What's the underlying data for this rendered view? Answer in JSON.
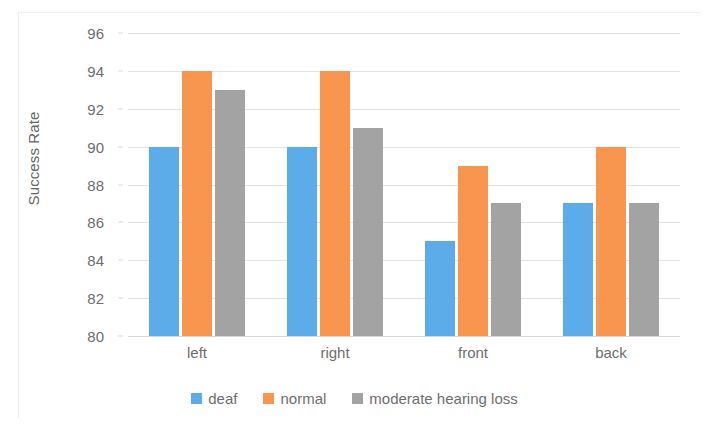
{
  "chart_data": {
    "type": "bar",
    "title": "",
    "subtitle": "",
    "xlabel": "",
    "ylabel": "Success Rate",
    "categories": [
      "left",
      "right",
      "front",
      "back"
    ],
    "series": [
      {
        "name": "deaf",
        "color": "#5BACE8",
        "values": [
          90,
          90,
          85,
          87
        ]
      },
      {
        "name": "normal",
        "color": "#F89650",
        "values": [
          94,
          94,
          89,
          90
        ]
      },
      {
        "name": "moderate hearing loss",
        "color": "#A3A3A3",
        "values": [
          93,
          91,
          87,
          87
        ]
      }
    ],
    "ylim": [
      80,
      96
    ],
    "ytick_step": 2,
    "yticks": [
      96,
      94,
      92,
      90,
      88,
      86,
      84,
      82,
      80
    ],
    "ytick_labels": [
      "96",
      "94",
      "92",
      "90",
      "88",
      "86",
      "84",
      "82",
      "80"
    ],
    "grid": true,
    "grid_axis": "y",
    "legend_position": "bottom",
    "legend_entries": [
      "deaf",
      "normal",
      "moderate hearing loss"
    ],
    "grouping": "grouped",
    "colors": {
      "deaf": "#5BACE8",
      "normal": "#F89650",
      "moderate_hearing_loss": "#A3A3A3",
      "gridline": "#E2E2E2",
      "text": "#6E6E6E",
      "background": "#FFFFFF"
    }
  }
}
